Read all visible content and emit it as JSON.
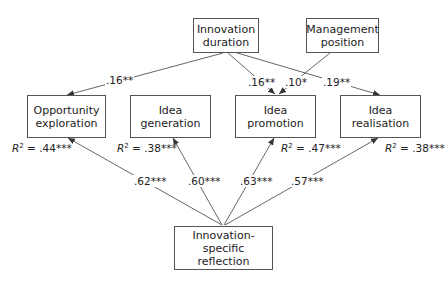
{
  "nodes": {
    "innovation_duration": {
      "line1": "Innovation",
      "line2": "duration"
    },
    "management_position": {
      "line1": "Management",
      "line2": "position"
    },
    "opportunity_exploration": {
      "line1": "Opportunity",
      "line2": "exploration",
      "r2": "= .44***"
    },
    "idea_generation": {
      "line1": "Idea generation",
      "r2": "= .38***"
    },
    "idea_promotion": {
      "line1": "Idea promotion",
      "r2": "= .47***"
    },
    "idea_realisation": {
      "line1": "Idea realisation",
      "r2": "= .38***"
    },
    "innovation_specific_reflection": {
      "line1": "Innovation-specific",
      "line2": "reflection"
    }
  },
  "r2_symbol": "R",
  "r2_exp": "2",
  "paths": {
    "duration_to_exploration": ".16**",
    "duration_to_promotion": ".16**",
    "management_to_promotion": ".10*",
    "duration_to_realisation": ".19**",
    "reflection_to_exploration": ".62***",
    "reflection_to_generation": ".60***",
    "reflection_to_promotion": ".63***",
    "reflection_to_realisation": ".57***"
  },
  "colors": {
    "line": "#555555",
    "text": "#222222",
    "background": "#ffffff"
  }
}
